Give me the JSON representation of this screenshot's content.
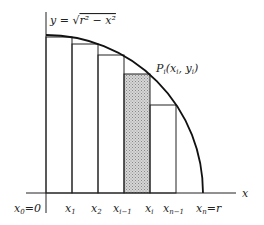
{
  "diagram": {
    "equation": "y = √(r² − x²)",
    "point_label": "P_i(x_i, y_i)",
    "axis_x_label": "x",
    "x_ticks": [
      "x0=0",
      "x1",
      "x2",
      "x_{i-1}",
      "x_i",
      "x_{n-1}",
      "x_n=r"
    ],
    "shaded_strip": "x_{i-1} to x_i",
    "colors": {
      "stroke": "#222222",
      "shade": "#bbbbbb"
    }
  }
}
